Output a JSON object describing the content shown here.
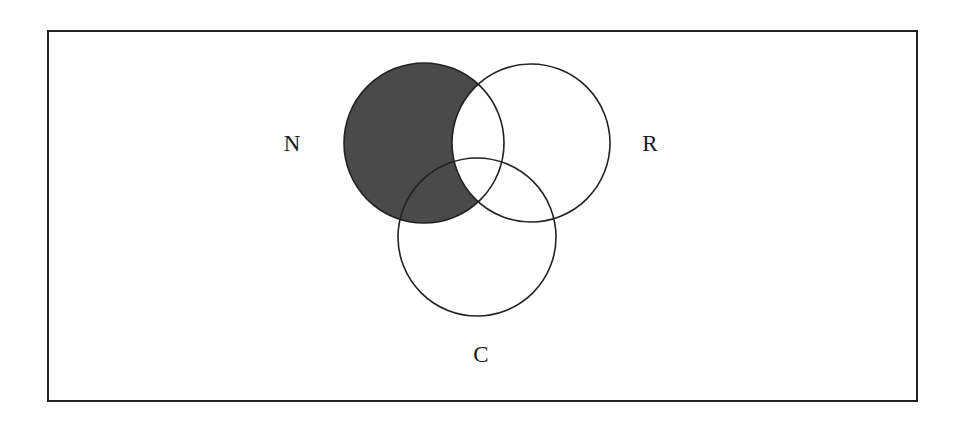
{
  "diagram": {
    "type": "venn",
    "frame": {
      "x": 48,
      "y": 31,
      "width": 869,
      "height": 370,
      "stroke": "#222222"
    },
    "sets": [
      {
        "id": "N",
        "label": "N",
        "cx": 424,
        "cy": 143,
        "r": 80,
        "label_x": 292,
        "label_y": 151
      },
      {
        "id": "R",
        "label": "R",
        "cx": 531,
        "cy": 143,
        "r": 79,
        "label_x": 650,
        "label_y": 151
      },
      {
        "id": "C",
        "label": "C",
        "cx": 477,
        "cy": 237,
        "r": 79,
        "label_x": 481,
        "label_y": 362
      }
    ],
    "shaded_region": {
      "description": "N minus R",
      "fill": "#4a4a4a"
    },
    "stroke_color": "#222222"
  }
}
